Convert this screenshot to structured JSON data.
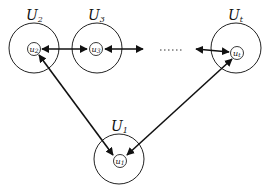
{
  "diagram": {
    "type": "network",
    "colors": {
      "stroke": "#222222",
      "background": "#ffffff"
    },
    "groups": [
      {
        "id": "U2",
        "label": "U",
        "sub": "2",
        "node": {
          "label": "u",
          "sub": "2"
        }
      },
      {
        "id": "U3",
        "label": "U",
        "sub": "3",
        "node": {
          "label": "u",
          "sub": "3"
        }
      },
      {
        "id": "Ut",
        "label": "U",
        "sub": "t",
        "node": {
          "label": "u",
          "sub": "t"
        }
      },
      {
        "id": "U1",
        "label": "U",
        "sub": "1",
        "node": {
          "label": "u",
          "sub": "1"
        }
      }
    ],
    "ellipsis": "......",
    "edges": [
      {
        "from": "u2",
        "to": "u3",
        "direction": "bidirectional"
      },
      {
        "from": "u3",
        "to": "...",
        "direction": "right"
      },
      {
        "from": "...",
        "to": "ut",
        "direction": "bidirectional"
      },
      {
        "from": "u1",
        "to": "u2",
        "direction": "bidirectional"
      },
      {
        "from": "u1",
        "to": "ut",
        "direction": "bidirectional"
      }
    ]
  }
}
